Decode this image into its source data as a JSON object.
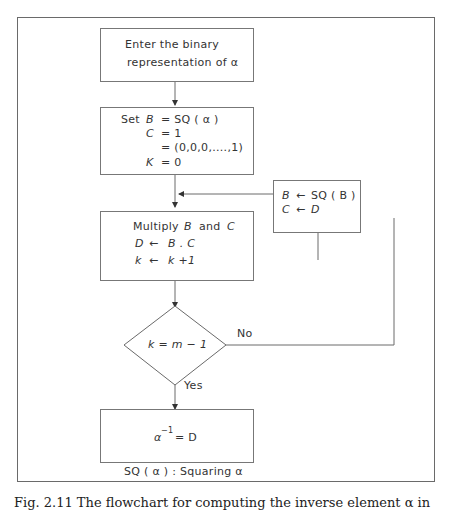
{
  "figure": {
    "boxes": {
      "input": {
        "line1": "Enter the binary",
        "line2": "representation of α"
      },
      "init": {
        "set_label": "Set",
        "b_var": "B",
        "b_expr": "= SQ ( α )",
        "c_var": "C",
        "c_expr": "=   1",
        "c_vector": "= (0,0,0,....,1)",
        "k_var": "K",
        "k_expr": "=   0"
      },
      "multiply": {
        "line1_a": "Multiply",
        "line1_b": "B",
        "line1_c": "and",
        "line1_d": "C",
        "line2_var": "D",
        "line2_op": "←",
        "line2_expr": "B . C",
        "line3_var": "k",
        "line3_op": "←",
        "line3_expr": "k +1"
      },
      "update": {
        "line1_var": "B",
        "line1_op": "←",
        "line1_expr": "SQ ( B )",
        "line2_var": "C",
        "line2_op": "←",
        "line2_expr": "D"
      },
      "result": {
        "base": "α",
        "exp": "−1",
        "expr": "=  D"
      }
    },
    "decision": {
      "text": "k  =  m  −  1",
      "no_label": "No",
      "yes_label": "Yes"
    },
    "legend": "SQ ( α )  :  Squaring α",
    "caption": "Fig. 2.11   The flowchart for computing the inverse element α in"
  },
  "colors": {
    "line": "#6a6a6a",
    "text": "#333333",
    "background": "#ffffff"
  }
}
